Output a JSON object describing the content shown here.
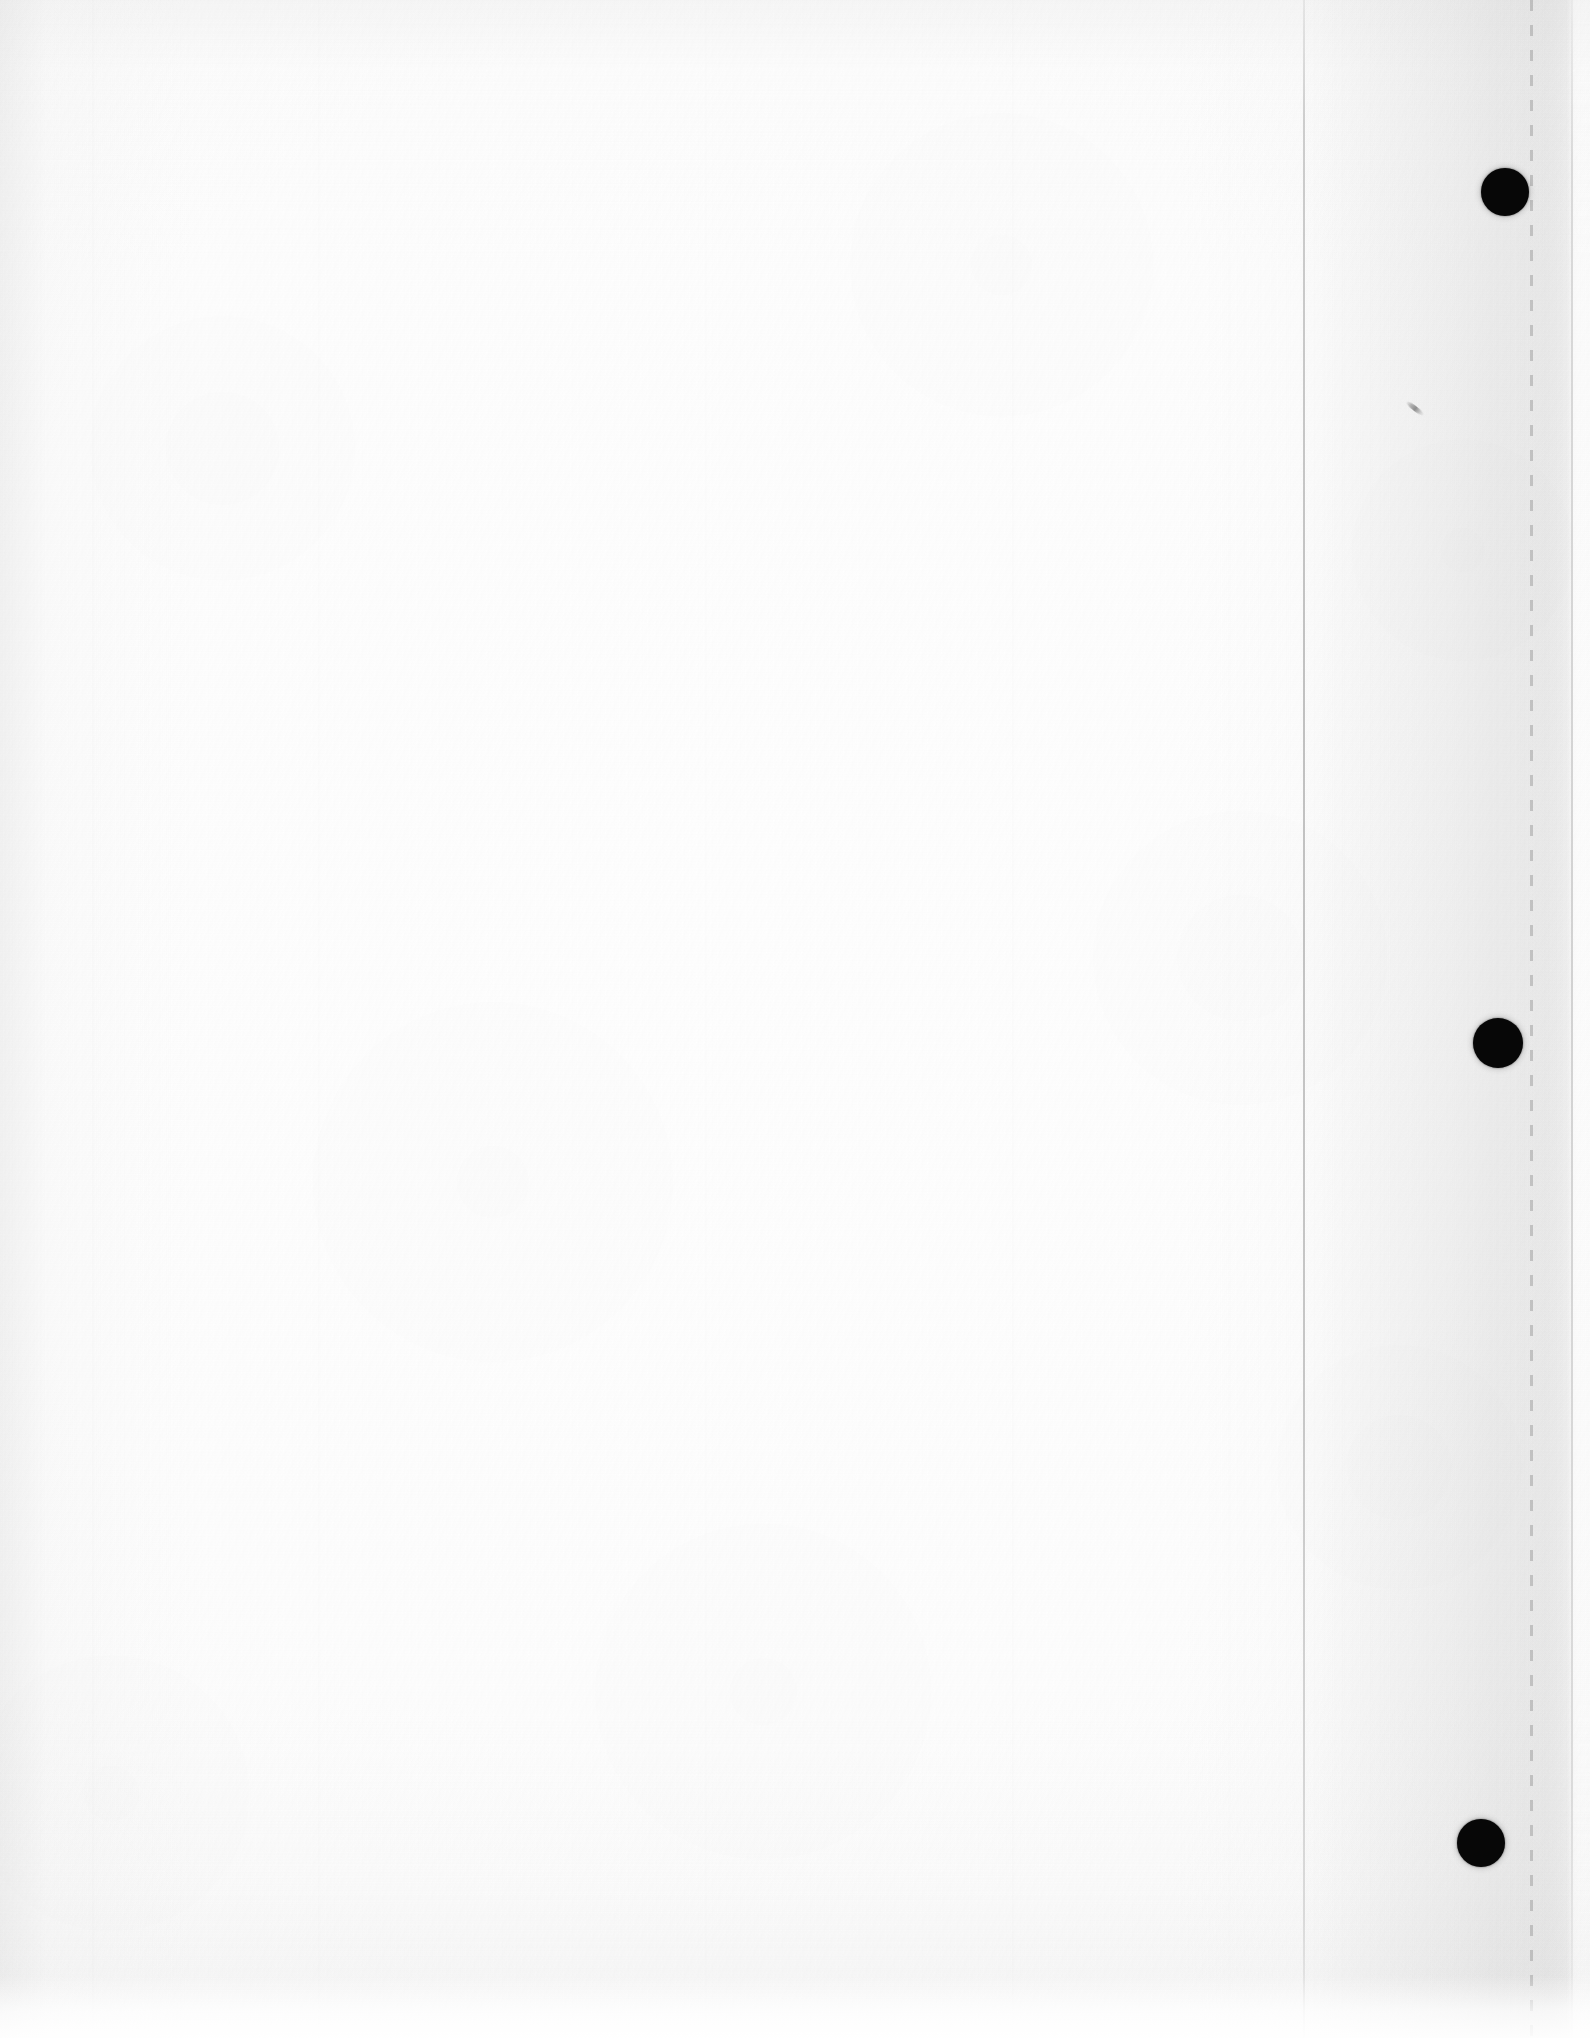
{
  "document": {
    "kind": "scanned-page",
    "description": "Blank scanned loose-leaf sheet",
    "content_text": "",
    "page_width": 1590,
    "page_height": 2038,
    "background_color": "#fdfdfd",
    "ink_color": "#070707"
  },
  "paper": {
    "base_color": "#fdfdfd",
    "highlight_color": "#ffffff",
    "shadow_color": "#f3f3f3",
    "texture": "fibrous",
    "vignette": true
  },
  "binder_holes": {
    "count": 3,
    "color": "#070707",
    "items": [
      {
        "name": "top",
        "cx": 1505,
        "cy": 192,
        "r": 24
      },
      {
        "name": "middle",
        "cx": 1498,
        "cy": 1043,
        "r": 25
      },
      {
        "name": "bottom",
        "cx": 1481,
        "cy": 1843,
        "r": 24
      }
    ]
  },
  "perforation": {
    "x": 1530,
    "width": 3,
    "dash_length": 11,
    "gap_length": 14,
    "color": "#9a9a9a",
    "opacity": 0.5
  },
  "crease": {
    "x": 1303,
    "width": 2,
    "color": "#b8b8b8"
  },
  "page_edge": {
    "x": 1571,
    "width": 2,
    "color": "#bebebe",
    "shadow_start": 1500,
    "shadow_width": 72
  },
  "margin_band": {
    "x": 1304,
    "width": 268,
    "color": "#f0f0f0"
  },
  "marks": [
    {
      "name": "pencil-smudge",
      "x": 1404,
      "y": 406,
      "width": 22,
      "height": 5,
      "rotation_deg": 38,
      "color": "#686868"
    }
  ],
  "bottom_band": {
    "y": 1975,
    "height": 63,
    "color": "#ffffff"
  }
}
